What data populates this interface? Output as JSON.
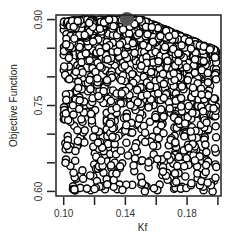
{
  "chart_data": {
    "type": "scatter",
    "title": "",
    "xlabel": "Kf",
    "ylabel": "Objective Function",
    "xlim": [
      0.095,
      0.202
    ],
    "ylim": [
      0.592,
      0.908
    ],
    "x_ticks": [
      0.1,
      0.12,
      0.14,
      0.16,
      0.18,
      0.2
    ],
    "x_tick_labels": [
      "0.10",
      "",
      "0.14",
      "",
      "0.18",
      ""
    ],
    "y_ticks": [
      0.6,
      0.65,
      0.7,
      0.75,
      0.8,
      0.85,
      0.9
    ],
    "y_tick_labels": [
      "0.60",
      "",
      "",
      "0.75",
      "",
      "",
      "0.90"
    ],
    "grid": false,
    "marker": "open-circle",
    "marker_color": "#000000",
    "highlight_point": {
      "x": 0.141,
      "y": 0.901,
      "color": "#555555"
    },
    "point_generation": {
      "count": 1400,
      "seed": 7
    }
  }
}
